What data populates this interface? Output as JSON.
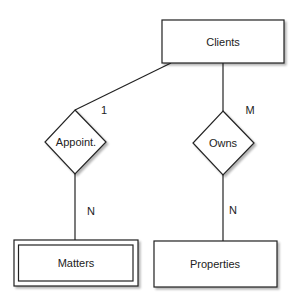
{
  "diagram": {
    "type": "entity-relationship",
    "colors": {
      "stroke": "#222222",
      "shadow": "#c8c8c8",
      "text": "#222222",
      "background": "#ffffff"
    },
    "entities": [
      {
        "id": "clients",
        "label": "Clients",
        "weak": false
      },
      {
        "id": "matters",
        "label": "Matters",
        "weak": true
      },
      {
        "id": "properties",
        "label": "Properties",
        "weak": false
      }
    ],
    "relationships": [
      {
        "id": "appoint",
        "label": "Appoint.",
        "from": "clients",
        "to": "matters",
        "from_cardinality": "1",
        "to_cardinality": "N"
      },
      {
        "id": "owns",
        "label": "Owns",
        "from": "clients",
        "to": "properties",
        "from_cardinality": "M",
        "to_cardinality": "N"
      }
    ]
  }
}
